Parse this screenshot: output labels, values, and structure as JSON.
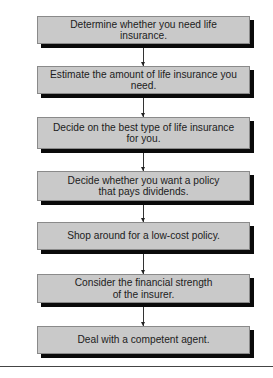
{
  "diagram": {
    "type": "flowchart",
    "direction": "top-to-bottom",
    "steps": [
      {
        "label": "Determine whether you need life insurance."
      },
      {
        "label": "Estimate the amount of life insurance you need."
      },
      {
        "label": "Decide on the best type of life insurance\nfor you."
      },
      {
        "label": "Decide whether you want a policy\nthat pays dividends."
      },
      {
        "label": "Shop around for a low-cost policy."
      },
      {
        "label": "Consider the financial strength\nof the insurer."
      },
      {
        "label": "Deal with a competent agent."
      }
    ],
    "colors": {
      "box_fill": "#c9c9c9",
      "box_shadow": "#0a0a0a",
      "text": "#1c1c1c",
      "arrow": "#333333"
    }
  }
}
